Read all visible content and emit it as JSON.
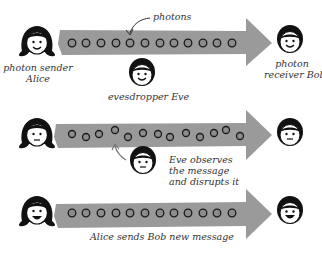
{
  "diagram": {
    "colors": {
      "arrow": "#9a9a9a",
      "photon_fill": "#8c8c8c",
      "photon_stroke": "#1a1a1a",
      "face_fill": "#ffffff",
      "hair": "#111111",
      "text": "#333333",
      "pointer_arrow": "#777777"
    },
    "rows": [
      {
        "id": "row1",
        "sender": "Alice",
        "receiver": "Bob",
        "photon_count": 13,
        "photon_pattern": "aligned",
        "alice_expression": "smile",
        "bob_expression": "smile"
      },
      {
        "id": "row2",
        "sender": "Alice",
        "receiver": "Bob",
        "photon_count": 13,
        "photon_pattern": "disrupted",
        "alice_expression": "neutral",
        "bob_expression": "neutral",
        "eve_expression": "neutral"
      },
      {
        "id": "row3",
        "sender": "Alice",
        "receiver": "Bob",
        "photon_count": 13,
        "photon_pattern": "aligned",
        "alice_expression": "big-smile",
        "bob_expression": "big-smile"
      }
    ],
    "labels": {
      "photons": "photons",
      "sender_line1": "photon sender",
      "sender_line2": "Alice",
      "receiver_line1": "photon",
      "receiver_line2": "receiver Bob",
      "eavesdropper": "evesdropper Eve",
      "eve_obs_line1": "Eve observes",
      "eve_obs_line2": "the message",
      "eve_obs_line3": "and disrupts it",
      "new_message": "Alice sends Bob new message"
    }
  }
}
